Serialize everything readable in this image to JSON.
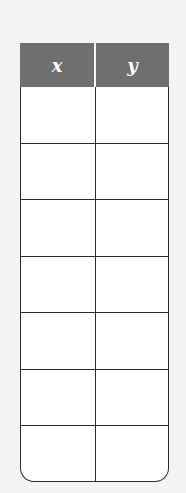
{
  "table": {
    "headers": [
      "x",
      "y"
    ],
    "rows": [
      [
        "",
        ""
      ],
      [
        "",
        ""
      ],
      [
        "",
        ""
      ],
      [
        "",
        ""
      ],
      [
        "",
        ""
      ],
      [
        "",
        ""
      ],
      [
        "",
        ""
      ]
    ]
  },
  "colors": {
    "header_bg": "#6f6f6f",
    "header_text": "#ffffff",
    "border": "#2a2a2a",
    "cell_bg": "#ffffff"
  }
}
